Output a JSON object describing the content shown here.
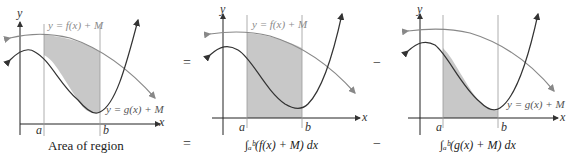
{
  "panels": [
    {
      "id": "left",
      "caption": "Area of region",
      "f_label": "y = f(x) + M",
      "g_label": "y = g(x) + M",
      "shading": "between f and g on [a,b]"
    },
    {
      "id": "middle",
      "caption": "∫ₐᵇ(f(x) + M) dx",
      "f_label": "y = f(x) + M",
      "shading": "under f on [a,b]"
    },
    {
      "id": "right",
      "caption": "∫ₐᵇ(g(x) + M) dx",
      "g_label": "y = g(x) + M",
      "shading": "under g on [a,b]"
    }
  ],
  "axes": {
    "x": "x",
    "y": "y",
    "a": "a",
    "b": "b"
  },
  "operators": {
    "top_eq": "=",
    "top_minus": "−",
    "bottom_eq": "=",
    "bottom_minus": "−"
  },
  "colors": {
    "shade": "#c8c8c8",
    "f_curve": "#7a7a7a",
    "g_curve": "#333333",
    "axis": "#222222",
    "label": "#8a8a8a"
  }
}
